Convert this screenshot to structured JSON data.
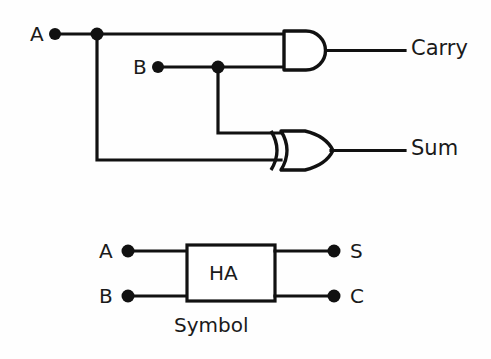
{
  "figure": {
    "background_color": "#fefefe",
    "line_color": "#111111",
    "circuit": {
      "inputs": [
        {
          "label": "A",
          "x": 30,
          "y": 24
        },
        {
          "label": "B",
          "x": 133,
          "y": 57
        }
      ],
      "outputs": [
        {
          "label": "Carry",
          "x": 411,
          "y": 37
        },
        {
          "label": "Sum",
          "x": 411,
          "y": 137
        }
      ],
      "gates": [
        {
          "type": "AND",
          "output": "Carry"
        },
        {
          "type": "XOR",
          "output": "Sum"
        }
      ]
    },
    "symbol": {
      "block_label": "HA",
      "caption": "Symbol",
      "inputs": [
        {
          "label": "A",
          "x": 103,
          "y": 240
        },
        {
          "label": "B",
          "x": 103,
          "y": 285
        }
      ],
      "outputs": [
        {
          "label": "S",
          "x": 348,
          "y": 240
        },
        {
          "label": "C",
          "x": 348,
          "y": 285
        }
      ]
    }
  }
}
